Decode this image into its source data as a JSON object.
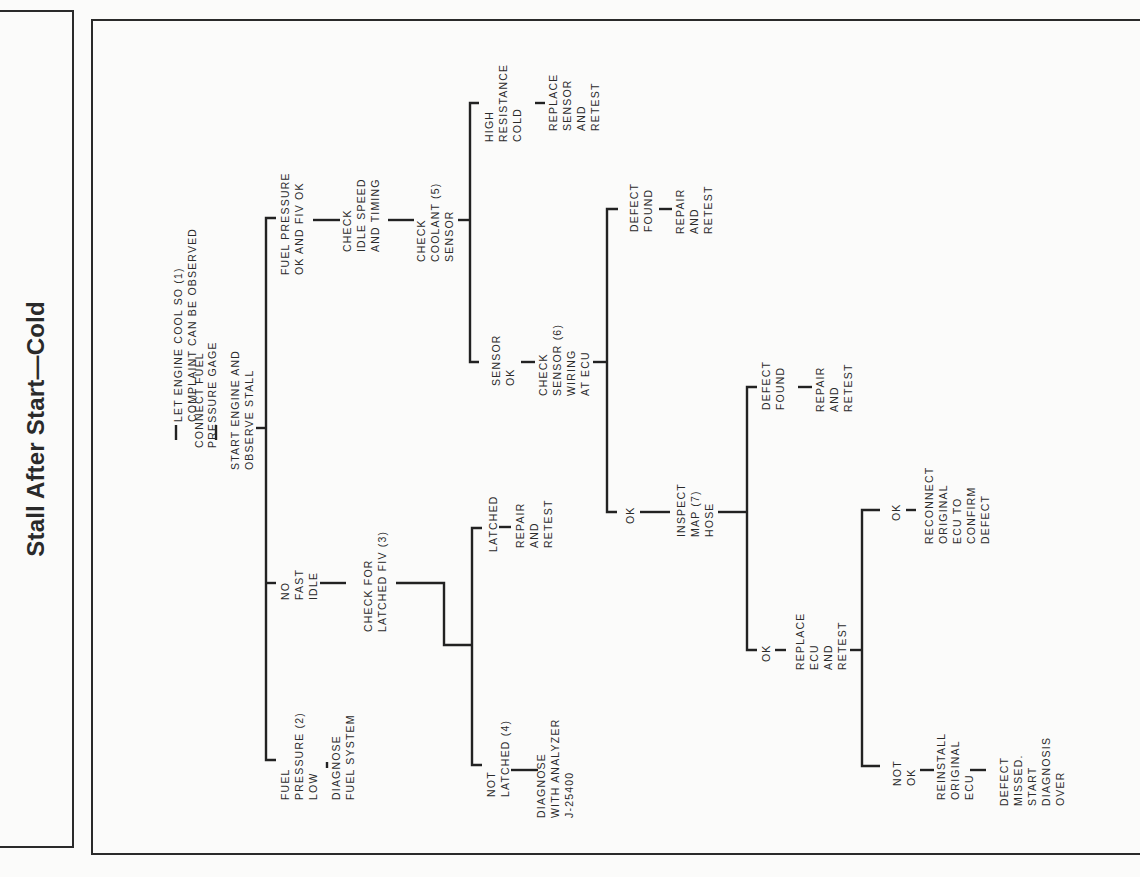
{
  "title": "Stall After Start—Cold",
  "nodes": {
    "n1": [
      "LET ENGINE COOL SO (1)",
      "COMPLAINT CAN BE OBSERVED"
    ],
    "n2": [
      "CONNECT FUEL",
      "PRESSURE GAGE"
    ],
    "n3": [
      "START ENGINE AND",
      "OBSERVE STALL"
    ],
    "fuel_ok": [
      "FUEL PRESSURE",
      "OK AND FIV OK"
    ],
    "check_idle": [
      "CHECK",
      "IDLE SPEED",
      "AND TIMING"
    ],
    "check_coolant": [
      "CHECK",
      "COOLANT (5)",
      "SENSOR"
    ],
    "high_res": [
      "HIGH",
      "RESISTANCE",
      "COLD"
    ],
    "replace_sensor": [
      "REPLACE",
      "SENSOR",
      "AND",
      "RETEST"
    ],
    "sensor_ok": [
      "SENSOR",
      "OK"
    ],
    "check_wiring": [
      "CHECK",
      "SENSOR (6)",
      "WIRING",
      "AT ECU"
    ],
    "defect_found_1": [
      "DEFECT",
      "FOUND"
    ],
    "repair_1": [
      "REPAIR",
      "AND",
      "RETEST"
    ],
    "ok_1": [
      "OK"
    ],
    "inspect_map": [
      "INSPECT",
      "MAP (7)",
      "HOSE"
    ],
    "defect_found_2": [
      "DEFECT",
      "FOUND"
    ],
    "repair_2": [
      "REPAIR",
      "AND",
      "RETEST"
    ],
    "ok_2": [
      "OK"
    ],
    "replace_ecu": [
      "REPLACE",
      "ECU",
      "AND",
      "RETEST"
    ],
    "ok_3": [
      "OK"
    ],
    "reconnect": [
      "RECONNECT",
      "ORIGINAL",
      "ECU TO",
      "CONFIRM",
      "DEFECT"
    ],
    "not_ok": [
      "NOT",
      "OK"
    ],
    "reinstall": [
      "REINSTALL",
      "ORIGINAL",
      "ECU"
    ],
    "defect_missed": [
      "DEFECT",
      "MISSED.",
      "START",
      "DIAGNOSIS",
      "OVER"
    ],
    "no_fast_idle": [
      "NO",
      "FAST",
      "IDLE"
    ],
    "check_latched": [
      "CHECK FOR",
      "LATCHED FIV (3)"
    ],
    "latched": [
      "LATCHED"
    ],
    "repair_3": [
      "REPAIR",
      "AND",
      "RETEST"
    ],
    "not_latched": [
      "NOT",
      "LATCHED (4)"
    ],
    "diagnose_analyzer": [
      "DIAGNOSE",
      "WITH ANALYZER",
      "J-25400"
    ],
    "fuel_low": [
      "FUEL",
      "PRESSURE (2)",
      "LOW"
    ],
    "diagnose_fuel": [
      "DIAGNOSE",
      "FUEL SYSTEM"
    ]
  }
}
